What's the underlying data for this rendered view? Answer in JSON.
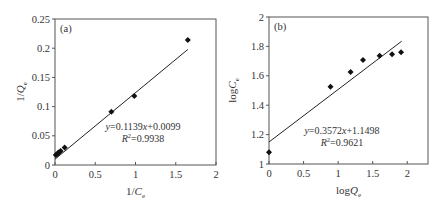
{
  "chart_data": [
    {
      "type": "scatter",
      "panel_label": "(a)",
      "title": "",
      "xlabel": "1/C_e",
      "ylabel": "1/Q_e",
      "xlim": [
        0,
        2
      ],
      "ylim": [
        0,
        0.25
      ],
      "xticks": [
        0,
        0.5,
        1,
        1.5,
        2
      ],
      "xtick_labels": [
        "0",
        "0.5",
        "1",
        "1.5",
        "2"
      ],
      "yticks": [
        0,
        0.05,
        0.1,
        0.15,
        0.2,
        0.25
      ],
      "ytick_labels": [
        "0",
        "0.05",
        "0.1",
        "0.15",
        "0.2",
        "0.25"
      ],
      "grid": false,
      "legend": null,
      "series": [
        {
          "name": "data",
          "marker": "diamond",
          "x": [
            0.01,
            0.02,
            0.035,
            0.05,
            0.07,
            0.12,
            0.7,
            0.985,
            1.65
          ],
          "y": [
            0.017,
            0.018,
            0.02,
            0.022,
            0.024,
            0.03,
            0.091,
            0.118,
            0.214
          ]
        }
      ],
      "fit_line": {
        "slope": 0.1139,
        "intercept": 0.0099,
        "x_range": [
          0,
          1.65
        ]
      },
      "annotations": [
        "y=0.1139x+0.0099",
        "R²=0.9938"
      ],
      "equation_text": "y=0.1139x+0.0099",
      "r2_text": "R²=0.9938"
    },
    {
      "type": "scatter",
      "panel_label": "(b)",
      "title": "",
      "xlabel": "logQ_e",
      "ylabel": "logC_e",
      "xlim": [
        0,
        2.3
      ],
      "ylim": [
        1,
        2
      ],
      "xticks": [
        0,
        0.5,
        1,
        1.5,
        2
      ],
      "xtick_labels": [
        "0",
        "0.5",
        "1",
        "1.5",
        "2"
      ],
      "yticks": [
        1,
        1.2,
        1.4,
        1.6,
        1.8,
        2
      ],
      "ytick_labels": [
        "1",
        "1.2",
        "1.4",
        "1.6",
        "1.8",
        "2"
      ],
      "grid": false,
      "legend": null,
      "series": [
        {
          "name": "data",
          "marker": "diamond",
          "x": [
            0,
            0.89,
            1.18,
            1.36,
            1.6,
            1.78,
            1.91
          ],
          "y": [
            1.08,
            1.526,
            1.626,
            1.707,
            1.736,
            1.746,
            1.76
          ]
        }
      ],
      "fit_line": {
        "slope": 0.3572,
        "intercept": 1.1498,
        "x_range": [
          0,
          1.92
        ]
      },
      "annotations": [
        "y=0.3572x+1.1498",
        "R²=0.9621"
      ],
      "equation_text": "y=0.3572x+1.1498",
      "r2_text": "R²=0.9621"
    }
  ],
  "layout": {
    "panels": [
      {
        "left": 55,
        "top": 19,
        "right": 216,
        "bottom": 165,
        "eq_x": 143,
        "eq_y": 130,
        "label_x": 60,
        "label_y": 32
      },
      {
        "left": 269,
        "top": 17,
        "right": 428,
        "bottom": 164,
        "eq_x": 342,
        "eq_y": 134,
        "label_x": 274,
        "label_y": 30
      }
    ],
    "colors": {
      "axis": "#555555",
      "marker": "#111111",
      "line": "#222222",
      "text": "#333333"
    }
  }
}
